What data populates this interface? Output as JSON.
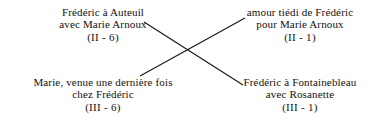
{
  "diagram": {
    "type": "chiasmus",
    "background_color": "#ffffff",
    "text_color": "#111111",
    "line_color": "#16181a",
    "nodes": {
      "top_left": {
        "line1": "Frédéric à Auteuil",
        "line2": "avec Marie Arnoux",
        "ref": "(II - 6)"
      },
      "top_right": {
        "line1": "amour tiédi de Frédéric",
        "line2": "pour Marie Arnoux",
        "ref": "(II - 1)"
      },
      "bottom_left": {
        "line1": "Marie, venue une dernière fois",
        "line2": "chez Frédéric",
        "ref": "(III - 6)"
      },
      "bottom_right": {
        "line1": "Frédéric à Fontainebleau",
        "line2": "avec Rosanette",
        "ref": "(III - 1)"
      }
    },
    "connectors": [
      {
        "name": "top-left-to-bottom-right",
        "from": "top_left",
        "to": "bottom_right",
        "x1": 144,
        "y1": 22,
        "x2": 243,
        "y2": 85
      },
      {
        "name": "bottom-left-to-top-right",
        "from": "bottom_left",
        "to": "top_right",
        "x1": 140,
        "y1": 76,
        "x2": 245,
        "y2": 18
      }
    ],
    "crossing_point": {
      "x": 189,
      "y": 52
    }
  }
}
